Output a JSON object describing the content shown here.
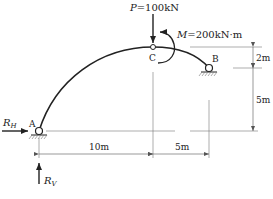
{
  "diagram": {
    "type": "three-hinged arch",
    "load": {
      "symbol": "P",
      "value": "=100kN"
    },
    "moment": {
      "symbol": "M",
      "value": "=200kN·m"
    },
    "points": {
      "A": "A",
      "B": "B",
      "C": "C"
    },
    "reactions": {
      "horizontal": {
        "symbol": "R",
        "sub": "H"
      },
      "vertical": {
        "symbol": "R",
        "sub": "V"
      }
    },
    "dimensions": {
      "horizontal_left": "10m",
      "horizontal_right": "5m",
      "vertical_top": "2m",
      "vertical_bottom": "5m"
    },
    "colors": {
      "line": "#222222",
      "dim": "#555555"
    }
  }
}
